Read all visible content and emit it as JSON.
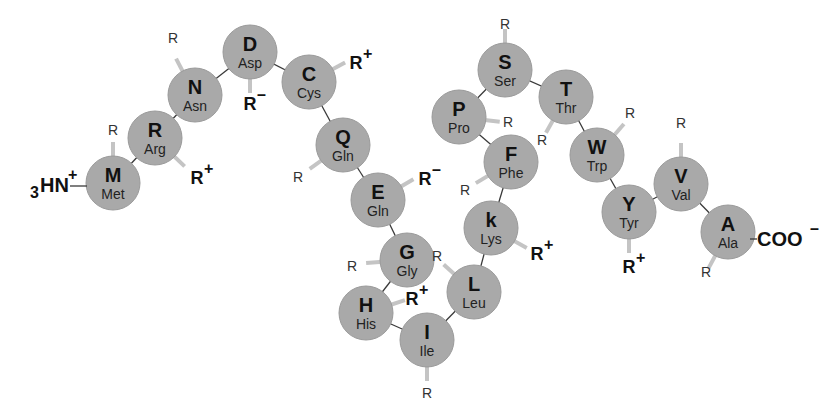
{
  "colors": {
    "residue_fill": "#a9a9a9",
    "bond": "#3a3a3a",
    "side_chain": "#c4c4c4",
    "text": "#111111"
  },
  "n_terminus": {
    "prefix": "3",
    "label": "HN",
    "charge": "+"
  },
  "c_terminus": {
    "label": "COO",
    "charge": "–"
  },
  "residues": [
    {
      "code": "M",
      "name": "Met",
      "x": 113,
      "y": 183,
      "r": {
        "label": "R",
        "charge": "",
        "x": 113,
        "y": 130,
        "lx": 113,
        "ly": 158
      }
    },
    {
      "code": "R",
      "name": "Arg",
      "x": 155,
      "y": 138,
      "r": {
        "label": "R",
        "charge": "+",
        "x": 197,
        "y": 177,
        "lx": 178,
        "ly": 160
      }
    },
    {
      "code": "N",
      "name": "Asn",
      "x": 195,
      "y": 95,
      "r": {
        "label": "R",
        "charge": "",
        "x": 173,
        "y": 38,
        "lx": 182,
        "ly": 70
      }
    },
    {
      "code": "D",
      "name": "Asp",
      "x": 250,
      "y": 52,
      "r": {
        "label": "R",
        "charge": "–",
        "x": 250,
        "y": 103,
        "lx": 250,
        "ly": 78
      }
    },
    {
      "code": "C",
      "name": "Cys",
      "x": 309,
      "y": 82,
      "r": {
        "label": "R",
        "charge": "+",
        "x": 356,
        "y": 62,
        "lx": 335,
        "ly": 68
      }
    },
    {
      "code": "Q",
      "name": "Gln",
      "x": 343,
      "y": 145,
      "r": {
        "label": "R",
        "charge": "",
        "x": 298,
        "y": 177,
        "lx": 318,
        "ly": 163
      }
    },
    {
      "code": "E",
      "name": "Gln",
      "x": 378,
      "y": 200,
      "r": {
        "label": "R",
        "charge": "–",
        "x": 425,
        "y": 178,
        "lx": 402,
        "ly": 186
      }
    },
    {
      "code": "G",
      "name": "Gly",
      "x": 407,
      "y": 260,
      "r": {
        "label": "R",
        "charge": "",
        "x": 352,
        "y": 266,
        "lx": 380,
        "ly": 262
      }
    },
    {
      "code": "H",
      "name": "His",
      "x": 366,
      "y": 313,
      "r": {
        "label": "R",
        "charge": "+",
        "x": 412,
        "y": 298,
        "lx": 390,
        "ly": 305
      }
    },
    {
      "code": "I",
      "name": "Ile",
      "x": 427,
      "y": 340,
      "r": {
        "label": "R",
        "charge": "",
        "x": 427,
        "y": 393,
        "lx": 427,
        "ly": 366
      }
    },
    {
      "code": "L",
      "name": "Leu",
      "x": 474,
      "y": 292,
      "r": {
        "label": "R",
        "charge": "",
        "x": 437,
        "y": 256,
        "lx": 452,
        "ly": 272
      }
    },
    {
      "code": "k",
      "name": "Lys",
      "x": 491,
      "y": 228,
      "r": {
        "label": "R",
        "charge": "+",
        "x": 537,
        "y": 253,
        "lx": 516,
        "ly": 242
      }
    },
    {
      "code": "F",
      "name": "Phe",
      "x": 511,
      "y": 162,
      "r": {
        "label": "R",
        "charge": "",
        "x": 465,
        "y": 190,
        "lx": 486,
        "ly": 177
      }
    },
    {
      "code": "P",
      "name": "Pro",
      "x": 459,
      "y": 117,
      "r": {
        "label": "R",
        "charge": "",
        "x": 508,
        "y": 122,
        "lx": 485,
        "ly": 120
      }
    },
    {
      "code": "S",
      "name": "Ser",
      "x": 505,
      "y": 70,
      "r": {
        "label": "R",
        "charge": "",
        "x": 505,
        "y": 24,
        "lx": 505,
        "ly": 44
      }
    },
    {
      "code": "T",
      "name": "Thr",
      "x": 566,
      "y": 97,
      "r": {
        "label": "R",
        "charge": "",
        "x": 542,
        "y": 140,
        "lx": 552,
        "ly": 122
      }
    },
    {
      "code": "W",
      "name": "Trp",
      "x": 597,
      "y": 155,
      "r": {
        "label": "R",
        "charge": "",
        "x": 630,
        "y": 113,
        "lx": 617,
        "ly": 132
      }
    },
    {
      "code": "Y",
      "name": "Tyr",
      "x": 629,
      "y": 212,
      "r": {
        "label": "R",
        "charge": "+",
        "x": 629,
        "y": 266,
        "lx": 629,
        "ly": 239
      }
    },
    {
      "code": "V",
      "name": "Val",
      "x": 681,
      "y": 184,
      "r": {
        "label": "R",
        "charge": "",
        "x": 681,
        "y": 123,
        "lx": 681,
        "ly": 158
      }
    },
    {
      "code": "A",
      "name": "Ala",
      "x": 728,
      "y": 232,
      "r": {
        "label": "R",
        "charge": "",
        "x": 706,
        "y": 272,
        "lx": 714,
        "ly": 258
      }
    }
  ]
}
